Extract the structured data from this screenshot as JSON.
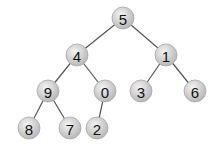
{
  "diagram": {
    "type": "binary-tree",
    "nodes": [
      {
        "id": "n5",
        "label": "5",
        "x": 123,
        "y": 18
      },
      {
        "id": "n4",
        "label": "4",
        "x": 77,
        "y": 55
      },
      {
        "id": "n1",
        "label": "1",
        "x": 166,
        "y": 55
      },
      {
        "id": "n9",
        "label": "9",
        "x": 48,
        "y": 91
      },
      {
        "id": "n0",
        "label": "0",
        "x": 105,
        "y": 91
      },
      {
        "id": "n3",
        "label": "3",
        "x": 141,
        "y": 91
      },
      {
        "id": "n6",
        "label": "6",
        "x": 195,
        "y": 91
      },
      {
        "id": "n8",
        "label": "8",
        "x": 29,
        "y": 128
      },
      {
        "id": "n7",
        "label": "7",
        "x": 70,
        "y": 128
      },
      {
        "id": "n2",
        "label": "2",
        "x": 97,
        "y": 128
      }
    ],
    "edges": [
      [
        "n5",
        "n4"
      ],
      [
        "n5",
        "n1"
      ],
      [
        "n4",
        "n9"
      ],
      [
        "n4",
        "n0"
      ],
      [
        "n1",
        "n3"
      ],
      [
        "n1",
        "n6"
      ],
      [
        "n9",
        "n8"
      ],
      [
        "n9",
        "n7"
      ],
      [
        "n0",
        "n2"
      ]
    ],
    "colors": {
      "node_fill_light": "#f2f2f2",
      "node_fill_dark": "#bdbdbd",
      "edge": "#555555",
      "text": "#111111"
    }
  }
}
